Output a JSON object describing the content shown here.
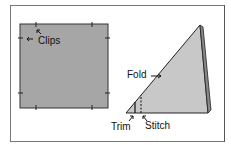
{
  "diagram": {
    "panels": [
      {
        "name": "square",
        "labels": [
          "Clips"
        ]
      },
      {
        "name": "triangle",
        "labels": [
          "Fold",
          "Trim",
          "Stitch"
        ]
      }
    ],
    "labels": {
      "clips": "Clips",
      "fold": "Fold",
      "trim": "Trim",
      "stitch": "Stitch"
    },
    "colors": {
      "fabric": "#a6a6a6",
      "triangle": "#c8c8c8",
      "outline": "#222222"
    }
  }
}
